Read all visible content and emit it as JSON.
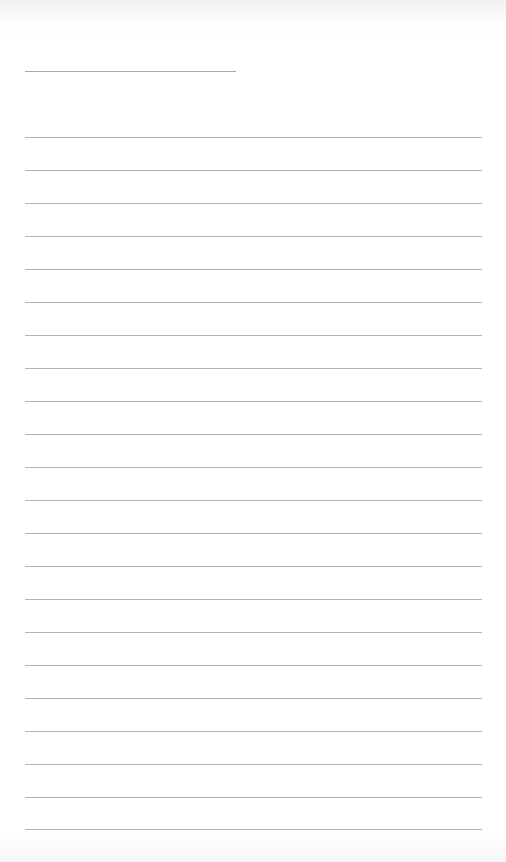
{
  "sheet": {
    "type": "lined-paper",
    "background_color": "#ffffff",
    "rule_color": "#b4b4b4",
    "header_line": {
      "left": 25,
      "top": 71,
      "width": 211
    },
    "rules": {
      "count": 22,
      "left": 25,
      "width": 457,
      "first_top": 137,
      "spacing": 33
    }
  }
}
